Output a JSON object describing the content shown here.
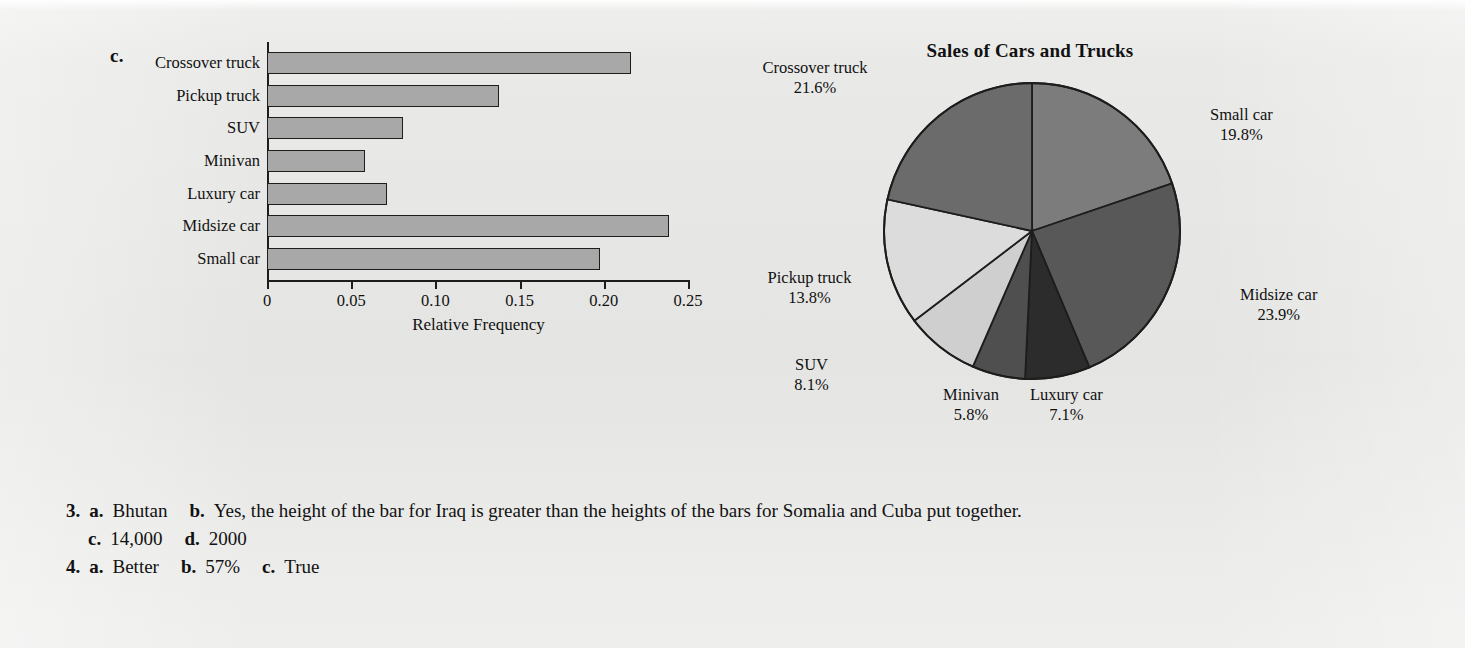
{
  "bar_section": {
    "part_letter": "c.",
    "x_axis_title": "Relative Frequency"
  },
  "pie_section": {
    "part_letter": "d.",
    "title": "Sales of Cars and Trucks"
  },
  "answers": {
    "line1": {
      "number": "3.",
      "a_letter": "a.",
      "a_text": "Bhutan",
      "b_letter": "b.",
      "b_text": "Yes, the height of the bar for Iraq is greater than the heights of the bars for Somalia and Cuba put together."
    },
    "line2": {
      "c_letter": "c.",
      "c_text": "14,000",
      "d_letter": "d.",
      "d_text": "2000"
    },
    "line3": {
      "number": "4.",
      "a_letter": "a.",
      "a_text": "Better",
      "b_letter": "b.",
      "b_text": "57%",
      "c_letter": "c.",
      "c_text": "True"
    }
  },
  "colors": {
    "page_background": "#e9e9e7",
    "bar_fill": "#a8a8a8",
    "bar_stroke": "#1d1d1d",
    "axis": "#1d1d1d",
    "text": "#111111"
  },
  "chart_data": [
    {
      "type": "bar",
      "orientation": "horizontal",
      "title": "",
      "xlabel": "Relative Frequency",
      "ylabel": "",
      "xlim": [
        0,
        0.25
      ],
      "xticks": [
        "0",
        "0.05",
        "0.10",
        "0.15",
        "0.20",
        "0.25"
      ],
      "xtick_values": [
        0,
        0.05,
        0.1,
        0.15,
        0.2,
        0.25
      ],
      "grid": false,
      "legend": "none",
      "categories": [
        "Small car",
        "Midsize car",
        "Luxury car",
        "Minivan",
        "SUV",
        "Pickup truck",
        "Crossover truck"
      ],
      "values": [
        0.198,
        0.239,
        0.071,
        0.058,
        0.081,
        0.138,
        0.216
      ],
      "bar_fill": "#a8a8a8",
      "bar_stroke": "#1d1d1d"
    },
    {
      "type": "pie",
      "title": "Sales of Cars and Trucks",
      "legend": "labels-outside",
      "start_angle_deg": 0,
      "direction": "clockwise",
      "labels": [
        "Small car",
        "Midsize car",
        "Luxury car",
        "Minivan",
        "SUV",
        "Pickup truck",
        "Crossover truck"
      ],
      "values": [
        19.8,
        23.9,
        7.1,
        5.8,
        8.1,
        13.8,
        21.6
      ],
      "value_suffix": "%",
      "slice_colors": [
        "#7c7c7c",
        "#585858",
        "#2c2c2c",
        "#4f4f4f",
        "#cfcfcf",
        "#dcdcdc",
        "#6b6b6b"
      ],
      "slice_stroke": "#1d1d1d",
      "slices": [
        {
          "label": "Small car",
          "percent": "19.8%",
          "value": 19.8,
          "color": "#7c7c7c"
        },
        {
          "label": "Midsize car",
          "percent": "23.9%",
          "value": 23.9,
          "color": "#585858"
        },
        {
          "label": "Luxury car",
          "percent": "7.1%",
          "value": 7.1,
          "color": "#2c2c2c"
        },
        {
          "label": "Minivan",
          "percent": "5.8%",
          "value": 5.8,
          "color": "#4f4f4f"
        },
        {
          "label": "SUV",
          "percent": "8.1%",
          "value": 8.1,
          "color": "#cfcfcf"
        },
        {
          "label": "Pickup truck",
          "percent": "13.8%",
          "value": 13.8,
          "color": "#dcdcdc"
        },
        {
          "label": "Crossover truck",
          "percent": "21.6%",
          "value": 21.6,
          "color": "#6b6b6b"
        }
      ]
    }
  ]
}
